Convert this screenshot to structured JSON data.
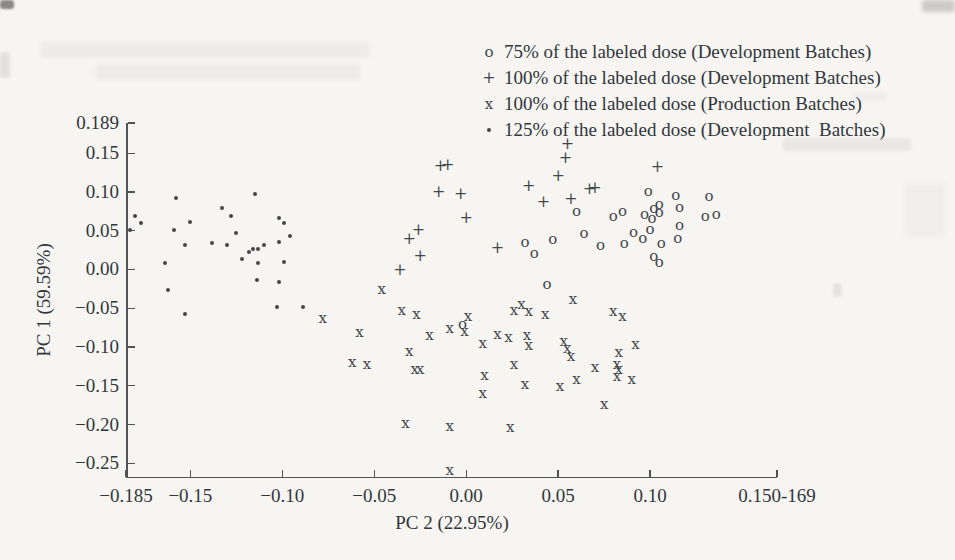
{
  "colors": {
    "paper": "#f6f5f2",
    "ink": "#32373b",
    "marker": "#43474a",
    "axis": "#4f5356"
  },
  "legend": {
    "items": [
      {
        "marker": "circle",
        "icon_glyph": "o",
        "label": "75% of the labeled dose (Development Batches)"
      },
      {
        "marker": "plus",
        "icon_glyph": "+",
        "label": "100% of the labeled dose (Development Batches)"
      },
      {
        "marker": "x",
        "icon_glyph": "x",
        "label": "100% of the labeled dose (Production Batches)"
      },
      {
        "marker": "dot",
        "icon_glyph": "•",
        "label": "125% of the labeled dose (Development  Batches)"
      }
    ]
  },
  "chart_data": {
    "type": "scatter",
    "title": "",
    "xlabel": "PC 2 (22.95%)",
    "ylabel": "PC 1 (59.59%)",
    "xlim": [
      -0.185,
      0.169
    ],
    "ylim": [
      -0.269,
      0.189
    ],
    "grid": false,
    "legend_position": "top-right",
    "x_ticks": [
      {
        "v": -0.185,
        "label": "−0.185"
      },
      {
        "v": -0.15,
        "label": "−0.15"
      },
      {
        "v": -0.1,
        "label": "−0.10"
      },
      {
        "v": -0.05,
        "label": "−0.05"
      },
      {
        "v": 0.0,
        "label": "0.00"
      },
      {
        "v": 0.05,
        "label": "0.05"
      },
      {
        "v": 0.1,
        "label": "0.10"
      },
      {
        "v": 0.169,
        "label": "0.150-169"
      }
    ],
    "y_ticks": [
      {
        "v": 0.189,
        "label": "0.189"
      },
      {
        "v": 0.15,
        "label": "0.15"
      },
      {
        "v": 0.1,
        "label": "0.10"
      },
      {
        "v": 0.05,
        "label": "0.05"
      },
      {
        "v": 0.0,
        "label": "0.00"
      },
      {
        "v": -0.05,
        "label": "−0.05"
      },
      {
        "v": -0.1,
        "label": "−0.10"
      },
      {
        "v": -0.15,
        "label": "−0.15"
      },
      {
        "v": -0.2,
        "label": "−0.20"
      },
      {
        "v": -0.25,
        "label": "−0.25"
      }
    ],
    "series": [
      {
        "name": "75% of the labeled dose (Development Batches)",
        "marker": "circle",
        "points": [
          [
            0.099,
            0.101
          ],
          [
            0.114,
            0.096
          ],
          [
            0.132,
            0.095
          ],
          [
            0.105,
            0.085
          ],
          [
            0.102,
            0.079
          ],
          [
            0.116,
            0.08
          ],
          [
            0.085,
            0.075
          ],
          [
            0.08,
            0.069
          ],
          [
            0.105,
            0.074
          ],
          [
            0.097,
            0.071
          ],
          [
            0.101,
            0.067
          ],
          [
            0.13,
            0.069
          ],
          [
            0.136,
            0.071
          ],
          [
            0.116,
            0.058
          ],
          [
            0.06,
            0.076
          ],
          [
            0.064,
            0.047
          ],
          [
            0.091,
            0.049
          ],
          [
            0.1,
            0.052
          ],
          [
            0.096,
            0.041
          ],
          [
            0.115,
            0.04
          ],
          [
            0.086,
            0.034
          ],
          [
            0.106,
            0.034
          ],
          [
            0.073,
            0.032
          ],
          [
            0.047,
            0.039
          ],
          [
            0.032,
            0.036
          ],
          [
            0.037,
            0.021
          ],
          [
            0.102,
            0.017
          ],
          [
            0.105,
            0.01
          ],
          [
            0.044,
            -0.019
          ],
          [
            -0.002,
            -0.07
          ]
        ]
      },
      {
        "name": "100% of the labeled dose (Development Batches)",
        "marker": "plus",
        "points": [
          [
            0.055,
            0.162
          ],
          [
            0.054,
            0.144
          ],
          [
            0.05,
            0.12
          ],
          [
            0.104,
            0.132
          ],
          [
            0.034,
            0.108
          ],
          [
            0.067,
            0.104
          ],
          [
            0.07,
            0.105
          ],
          [
            0.057,
            0.091
          ],
          [
            0.042,
            0.087
          ],
          [
            -0.014,
            0.133
          ],
          [
            -0.01,
            0.135
          ],
          [
            -0.015,
            0.1
          ],
          [
            -0.003,
            0.097
          ],
          [
            0.0,
            0.066
          ],
          [
            0.017,
            0.028
          ],
          [
            -0.026,
            0.051
          ],
          [
            -0.031,
            0.039
          ],
          [
            -0.025,
            0.017
          ],
          [
            -0.036,
            -0.001
          ]
        ]
      },
      {
        "name": "100% of the labeled dose (Production Batches)",
        "marker": "x",
        "points": [
          [
            -0.046,
            -0.025
          ],
          [
            -0.078,
            -0.062
          ],
          [
            -0.035,
            -0.052
          ],
          [
            -0.027,
            -0.058
          ],
          [
            -0.058,
            -0.08
          ],
          [
            -0.02,
            -0.085
          ],
          [
            -0.009,
            -0.075
          ],
          [
            0.001,
            -0.06
          ],
          [
            -0.001,
            -0.079
          ],
          [
            0.017,
            -0.083
          ],
          [
            0.009,
            -0.095
          ],
          [
            0.023,
            -0.087
          ],
          [
            0.026,
            -0.052
          ],
          [
            0.03,
            -0.045
          ],
          [
            0.034,
            -0.054
          ],
          [
            0.033,
            -0.084
          ],
          [
            0.034,
            -0.097
          ],
          [
            0.043,
            -0.058
          ],
          [
            0.058,
            -0.038
          ],
          [
            0.053,
            -0.092
          ],
          [
            0.055,
            -0.101
          ],
          [
            0.057,
            -0.111
          ],
          [
            0.08,
            -0.053
          ],
          [
            0.085,
            -0.06
          ],
          [
            0.092,
            -0.096
          ],
          [
            0.083,
            -0.106
          ],
          [
            0.07,
            -0.126
          ],
          [
            0.082,
            -0.122
          ],
          [
            0.083,
            -0.128
          ],
          [
            0.082,
            -0.137
          ],
          [
            0.09,
            -0.141
          ],
          [
            0.06,
            -0.141
          ],
          [
            0.051,
            -0.15
          ],
          [
            0.075,
            -0.174
          ],
          [
            0.026,
            -0.122
          ],
          [
            0.01,
            -0.136
          ],
          [
            0.009,
            -0.159
          ],
          [
            0.032,
            -0.148
          ],
          [
            -0.062,
            -0.119
          ],
          [
            -0.054,
            -0.122
          ],
          [
            -0.031,
            -0.105
          ],
          [
            -0.028,
            -0.128
          ],
          [
            -0.025,
            -0.128
          ],
          [
            -0.033,
            -0.198
          ],
          [
            -0.009,
            -0.202
          ],
          [
            0.024,
            -0.203
          ],
          [
            -0.009,
            -0.259
          ]
        ]
      },
      {
        "name": "125% of the labeled dose (Development  Batches)",
        "marker": "dot",
        "points": [
          [
            -0.18,
            0.069
          ],
          [
            -0.177,
            0.06
          ],
          [
            -0.183,
            0.051
          ],
          [
            -0.158,
            0.092
          ],
          [
            -0.15,
            0.061
          ],
          [
            -0.159,
            0.051
          ],
          [
            -0.153,
            0.032
          ],
          [
            -0.164,
            0.008
          ],
          [
            -0.162,
            -0.026
          ],
          [
            -0.153,
            -0.058
          ],
          [
            -0.138,
            0.034
          ],
          [
            -0.133,
            0.079
          ],
          [
            -0.128,
            0.069
          ],
          [
            -0.13,
            0.032
          ],
          [
            -0.125,
            0.047
          ],
          [
            -0.115,
            0.098
          ],
          [
            -0.122,
            0.013
          ],
          [
            -0.118,
            0.023
          ],
          [
            -0.116,
            0.026
          ],
          [
            -0.113,
            0.027
          ],
          [
            -0.113,
            0.009
          ],
          [
            -0.11,
            0.032
          ],
          [
            -0.102,
            0.067
          ],
          [
            -0.099,
            0.06
          ],
          [
            -0.102,
            0.036
          ],
          [
            -0.096,
            0.043
          ],
          [
            -0.099,
            0.01
          ],
          [
            -0.102,
            -0.016
          ],
          [
            -0.114,
            -0.013
          ],
          [
            -0.103,
            -0.048
          ],
          [
            -0.089,
            -0.048
          ]
        ]
      }
    ]
  },
  "artifacts": [
    {
      "x": 0,
      "y": 0,
      "w": 14,
      "h": 9,
      "opacity": 0.7,
      "blur": 1,
      "color": "#5a5a5a"
    },
    {
      "x": 922,
      "y": 0,
      "w": 33,
      "h": 12,
      "opacity": 0.3,
      "blur": 2,
      "color": "#6a6a6a"
    },
    {
      "x": 40,
      "y": 42,
      "w": 330,
      "h": 16,
      "opacity": 0.05,
      "blur": 2,
      "color": "#555555"
    },
    {
      "x": 95,
      "y": 64,
      "w": 265,
      "h": 16,
      "opacity": 0.06,
      "blur": 2,
      "color": "#555555"
    },
    {
      "x": 0,
      "y": 52,
      "w": 10,
      "h": 26,
      "opacity": 0.12,
      "blur": 1.5,
      "color": "#555555"
    },
    {
      "x": 783,
      "y": 138,
      "w": 128,
      "h": 13,
      "opacity": 0.09,
      "blur": 1.5,
      "color": "#666666"
    },
    {
      "x": 852,
      "y": 92,
      "w": 34,
      "h": 9,
      "opacity": 0.05,
      "blur": 2,
      "color": "#666666"
    },
    {
      "x": 905,
      "y": 182,
      "w": 40,
      "h": 55,
      "opacity": 0.04,
      "blur": 3,
      "color": "#555555"
    },
    {
      "x": 833,
      "y": 283,
      "w": 9,
      "h": 14,
      "opacity": 0.11,
      "blur": 1,
      "color": "#666666"
    }
  ]
}
